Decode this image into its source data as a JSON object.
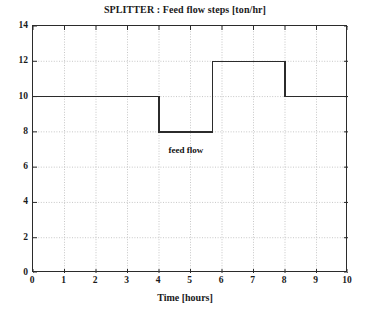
{
  "chart_data": {
    "type": "line",
    "title": "SPLITTER : Feed flow steps [ton/hr]",
    "xlabel": "Time [hours]",
    "ylabel": "",
    "xlim": [
      0,
      10
    ],
    "ylim": [
      0,
      14
    ],
    "grid": true,
    "legend_position": "none",
    "xticks": [
      0,
      1,
      2,
      3,
      4,
      5,
      6,
      7,
      8,
      9,
      10
    ],
    "xtick_labels": [
      "0",
      "1",
      "2",
      "3",
      "4",
      "5",
      "6",
      "7",
      "8",
      "9",
      "10"
    ],
    "yticks": [
      0,
      2,
      4,
      6,
      8,
      10,
      12,
      14
    ],
    "ytick_labels": [
      "0",
      "2",
      "4",
      "6",
      "8",
      "10",
      "12",
      "14"
    ],
    "series": [
      {
        "name": "feed flow",
        "step": "post",
        "color": "#2b2b2b",
        "x": [
          0,
          4,
          4,
          5.7,
          5.7,
          8,
          8,
          10
        ],
        "y": [
          10,
          10,
          8,
          8,
          12,
          12,
          10,
          10
        ],
        "segments": [
          {
            "x_start": 0,
            "x_end": 4,
            "value": 10
          },
          {
            "x_start": 4,
            "x_end": 5.7,
            "value": 8
          },
          {
            "x_start": 5.7,
            "x_end": 8,
            "value": 12
          },
          {
            "x_start": 8,
            "x_end": 10,
            "value": 10
          }
        ]
      }
    ],
    "annotations": [
      {
        "text": "feed flow",
        "x": 4.85,
        "y": 6.95
      }
    ],
    "colors": {
      "line": "#2b2b2b",
      "grid": "#b9b9b9",
      "axis": "#2b2b2b",
      "background": "#ffffff",
      "text": "#1a1a1a"
    }
  }
}
